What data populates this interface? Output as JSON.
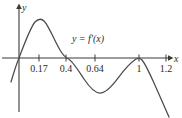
{
  "chart_data": {
    "type": "line",
    "title": "",
    "xlabel": "x",
    "ylabel": "y",
    "curve_label": "y = f'(x)",
    "grid": false,
    "legend_position": "inline-annotation",
    "xlim": [
      -0.06,
      1.32
    ],
    "ylim": [
      -1.1,
      1.05
    ],
    "x_ticks": [
      0.17,
      0.4,
      0.64,
      1,
      1.2
    ],
    "x_tick_labels": [
      "0.17",
      "0.4",
      "0.64",
      "1",
      "1.2"
    ],
    "y_ticks": [],
    "y_tick_labels": [],
    "zeros": [
      0,
      0.4,
      1
    ],
    "local_maximum_x": 0.17,
    "local_minimum_x": 0.64,
    "annotations": [
      {
        "text": "y = f'(x)",
        "x": 0.57,
        "y": 0.62
      }
    ],
    "x": [
      -0.06,
      -0.04,
      -0.02,
      0.0,
      0.02,
      0.05,
      0.08,
      0.11,
      0.14,
      0.17,
      0.2,
      0.23,
      0.26,
      0.3,
      0.34,
      0.37,
      0.4,
      0.44,
      0.48,
      0.52,
      0.56,
      0.6,
      0.64,
      0.68,
      0.72,
      0.76,
      0.8,
      0.84,
      0.88,
      0.92,
      0.96,
      1.0,
      1.04,
      1.08,
      1.12,
      1.16,
      1.2,
      1.24,
      1.28
    ],
    "y": [
      -0.52,
      -0.36,
      -0.18,
      0.0,
      0.19,
      0.44,
      0.63,
      0.76,
      0.82,
      0.84,
      0.82,
      0.76,
      0.66,
      0.47,
      0.25,
      0.1,
      0.0,
      -0.21,
      -0.37,
      -0.49,
      -0.56,
      -0.6,
      -0.61,
      -0.59,
      -0.54,
      -0.47,
      -0.38,
      -0.29,
      -0.2,
      -0.12,
      -0.05,
      0.0,
      -0.1,
      -0.26,
      -0.45,
      -0.66,
      -0.88,
      -1.05,
      -1.2
    ]
  },
  "geometry": {
    "x_axis_y_px": 58,
    "y_axis_x_px": 19,
    "tick_px": [
      39,
      66,
      95,
      139,
      166
    ],
    "tick_label_y_px": 71,
    "x_label_px": {
      "x": 174,
      "y": 59
    },
    "y_label_px": {
      "x": 23,
      "y": 10
    },
    "curve_label_px": {
      "x": 88,
      "y": 39
    },
    "curve_path": "M 11,82 C 14,72 16,65 19,58 C 24,45 30,28 35,22 C 38,19 41,18 44,21 C 49,26 54,40 60,50 C 63,55 65,57 67,58 C 72,60 78,70 84,79 C 90,88 95,93 100,93 C 106,93 112,86 118,78 C 124,70 130,63 136,59 C 138,58 140,58 142,60 C 147,66 152,79 158,92 C 162,101 166,110 169,117"
  },
  "colors": {
    "axis": "#3a3a3a",
    "curve": "#4a4a4a",
    "text": "#2b2b2b",
    "background": "#ffffff"
  }
}
